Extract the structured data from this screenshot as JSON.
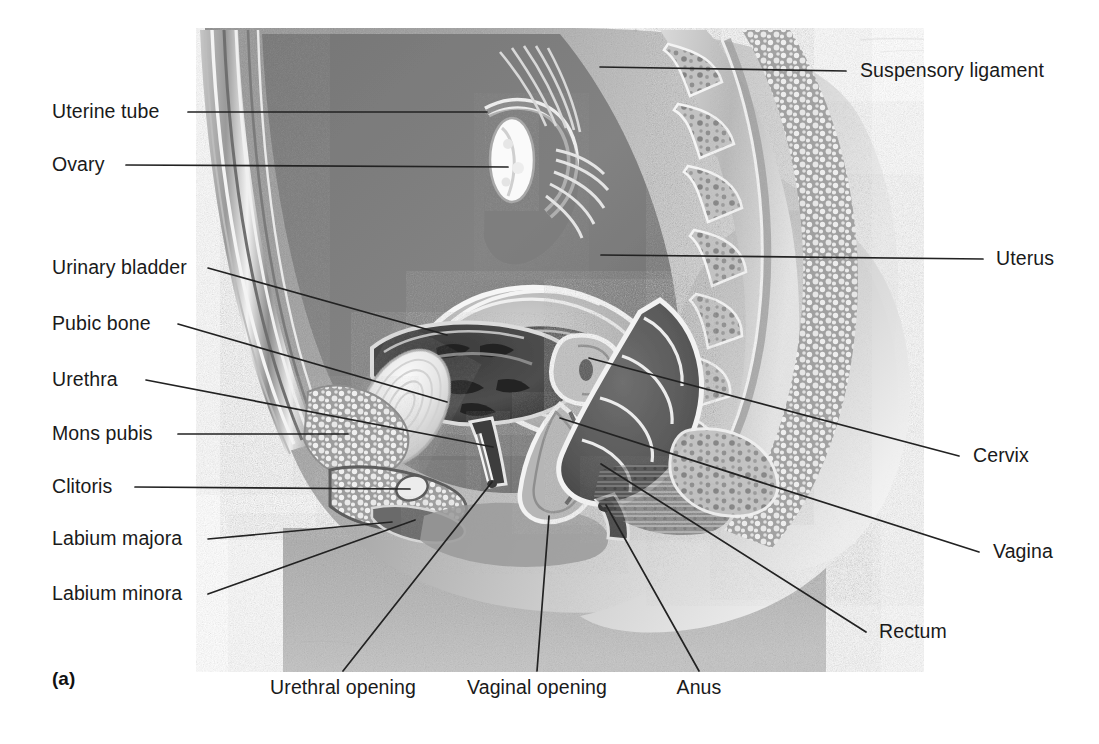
{
  "figure": {
    "panel_tag": "(a)",
    "background_color": "#ffffff",
    "ink_color": "#1a1a1a",
    "leader_line_color": "#222222"
  },
  "labels_left": [
    {
      "id": "uterine-tube",
      "text": "Uterine tube",
      "x": 52,
      "y": 112,
      "anchor_x": 188,
      "tip_x": 487,
      "tip_y": 112
    },
    {
      "id": "ovary",
      "text": "Ovary",
      "x": 52,
      "y": 165,
      "anchor_x": 126,
      "tip_x": 508,
      "tip_y": 167
    },
    {
      "id": "urinary-bladder",
      "text": "Urinary bladder",
      "x": 52,
      "y": 268,
      "anchor_x": 208,
      "tip_x": 447,
      "tip_y": 335
    },
    {
      "id": "pubic-bone",
      "text": "Pubic bone",
      "x": 52,
      "y": 324,
      "anchor_x": 178,
      "tip_x": 447,
      "tip_y": 402
    },
    {
      "id": "urethra",
      "text": "Urethra",
      "x": 52,
      "y": 380,
      "anchor_x": 146,
      "tip_x": 493,
      "tip_y": 447
    },
    {
      "id": "mons-pubis",
      "text": "Mons pubis",
      "x": 52,
      "y": 434,
      "anchor_x": 178,
      "tip_x": 348,
      "tip_y": 434
    },
    {
      "id": "clitoris",
      "text": "Clitoris",
      "x": 52,
      "y": 487,
      "anchor_x": 135,
      "tip_x": 410,
      "tip_y": 489
    },
    {
      "id": "labium-majora",
      "text": "Labium majora",
      "x": 52,
      "y": 539,
      "anchor_x": 208,
      "tip_x": 392,
      "tip_y": 522
    },
    {
      "id": "labium-minora",
      "text": "Labium minora",
      "x": 52,
      "y": 594,
      "anchor_x": 208,
      "tip_x": 415,
      "tip_y": 520
    }
  ],
  "labels_right": [
    {
      "id": "suspensory-ligament",
      "text": "Suspensory ligament",
      "x": 860,
      "y": 71,
      "anchor_x": 846,
      "tip_x": 600,
      "tip_y": 67
    },
    {
      "id": "uterus",
      "text": "Uterus",
      "x": 996,
      "y": 259,
      "anchor_x": 983,
      "tip_x": 601,
      "tip_y": 255
    },
    {
      "id": "cervix",
      "text": "Cervix",
      "x": 973,
      "y": 456,
      "anchor_x": 959,
      "tip_x": 589,
      "tip_y": 358
    },
    {
      "id": "vagina",
      "text": "Vagina",
      "x": 993,
      "y": 552,
      "anchor_x": 979,
      "tip_x": 560,
      "tip_y": 418
    },
    {
      "id": "rectum",
      "text": "Rectum",
      "x": 879,
      "y": 632,
      "anchor_x": 866,
      "tip_x": 601,
      "tip_y": 464
    }
  ],
  "labels_bottom": [
    {
      "id": "urethral-opening",
      "text": "Urethral opening",
      "x": 343,
      "y": 691,
      "tip_x": 492,
      "tip_y": 482
    },
    {
      "id": "vaginal-opening",
      "text": "Vaginal opening",
      "x": 537,
      "y": 691,
      "tip_x": 549,
      "tip_y": 516
    },
    {
      "id": "anus",
      "text": "Anus",
      "x": 699,
      "y": 691,
      "tip_x": 606,
      "tip_y": 505
    }
  ],
  "illustration": {
    "type": "grayscale-anatomical-halftone",
    "region": {
      "x": 196,
      "y": 28,
      "width": 728,
      "height": 644
    },
    "structures": [
      "abdominal wall layers",
      "uterine tube",
      "ovary",
      "uterus",
      "urinary bladder",
      "pubic bone (symphysis)",
      "urethra",
      "mons pubis",
      "clitoris",
      "labium majora",
      "labium minora",
      "cervix",
      "vagina",
      "rectum",
      "anus",
      "sacrum and vertebrae",
      "gluteal contour"
    ]
  }
}
